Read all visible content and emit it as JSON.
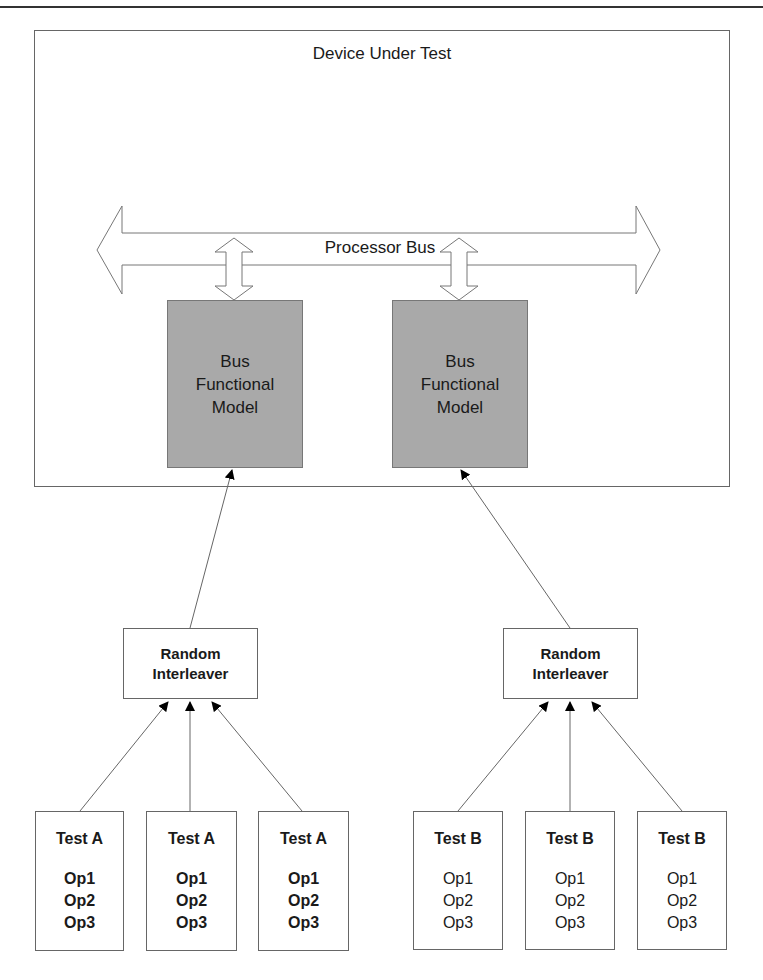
{
  "diagram": {
    "dut": {
      "title": "Device Under Test"
    },
    "bus": {
      "label": "Processor Bus"
    },
    "bfms": [
      {
        "line1": "Bus",
        "line2": "Functional",
        "line3": "Model"
      },
      {
        "line1": "Bus",
        "line2": "Functional",
        "line3": "Model"
      }
    ],
    "interleavers": [
      {
        "line1": "Random",
        "line2": "Interleaver"
      },
      {
        "line1": "Random",
        "line2": "Interleaver"
      }
    ],
    "tests": [
      {
        "title": "Test A",
        "ops": [
          "Op1",
          "Op2",
          "Op3"
        ]
      },
      {
        "title": "Test A",
        "ops": [
          "Op1",
          "Op2",
          "Op3"
        ]
      },
      {
        "title": "Test A",
        "ops": [
          "Op1",
          "Op2",
          "Op3"
        ]
      },
      {
        "title": "Test B",
        "ops": [
          "Op1",
          "Op2",
          "Op3"
        ]
      },
      {
        "title": "Test B",
        "ops": [
          "Op1",
          "Op2",
          "Op3"
        ]
      },
      {
        "title": "Test B",
        "ops": [
          "Op1",
          "Op2",
          "Op3"
        ]
      }
    ],
    "colors": {
      "bfm_fill": "#a9a9a9",
      "stroke": "#666666",
      "arrowhead": "#000000"
    }
  }
}
